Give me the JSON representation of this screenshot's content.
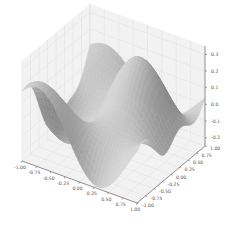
{
  "chart_data": {
    "type": "surface3d",
    "title": "",
    "xlabel": "",
    "ylabel": "",
    "zlabel": "",
    "colormap": "gray",
    "x_ticks": [
      "-1.00",
      "-0.75",
      "-0.50",
      "-0.25",
      "0.00",
      "0.25",
      "0.50",
      "0.75",
      "1.00"
    ],
    "y_ticks": [
      "-1.00",
      "-0.75",
      "-0.50",
      "-0.25",
      "0.00",
      "0.25",
      "0.50",
      "0.75",
      "1.00"
    ],
    "z_ticks": [
      "-0.2",
      "-0.1",
      "0.0",
      "0.1",
      "0.2",
      "0.3"
    ],
    "xlim": [
      -1,
      1
    ],
    "ylim": [
      -1,
      1
    ],
    "zlim": [
      -0.25,
      0.35
    ],
    "grid": true,
    "surface_description": "Smooth wavy surface with a high peak near back-left, a deep trough at front-center, a ridge along the back-right and a secondary dip near the right edge",
    "colors": {
      "pane": "#f2f2f2",
      "grid": "#dedede",
      "axis": "#555555",
      "surface_light": "#e8e8e8",
      "surface_dark": "#3a3a3a"
    }
  }
}
